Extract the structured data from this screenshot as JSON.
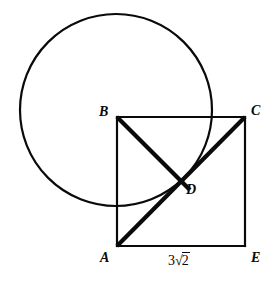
{
  "figure": {
    "kind": "geometry-diagram",
    "width": 275,
    "height": 281,
    "background_color": "#ffffff",
    "stroke_color": "#0a0a0a"
  },
  "vertices": {
    "A": {
      "label": "A",
      "x": 117,
      "y": 246,
      "label_x": 100,
      "label_y": 251
    },
    "B": {
      "label": "B",
      "x": 117,
      "y": 117,
      "label_x": 99,
      "label_y": 105
    },
    "C": {
      "label": "C",
      "x": 245,
      "y": 117,
      "label_x": 251,
      "label_y": 104
    },
    "D": {
      "label": "D",
      "x": 182,
      "y": 183,
      "label_x": 186,
      "label_y": 183
    },
    "E": {
      "label": "E",
      "x": 245,
      "y": 246,
      "label_x": 251,
      "label_y": 251
    }
  },
  "circle": {
    "name": "overlapping-circle",
    "center_x": 116,
    "center_y": 110,
    "radius": 96,
    "stroke_width": 2.2
  },
  "square": {
    "name": "square-ABCE",
    "sides": [
      {
        "name": "side-AB",
        "x1": 117,
        "y1": 246,
        "x2": 117,
        "y2": 117,
        "stroke_width": 2.2
      },
      {
        "name": "side-BC",
        "x1": 117,
        "y1": 117,
        "x2": 245,
        "y2": 117,
        "stroke_width": 2.2
      },
      {
        "name": "side-CE",
        "x1": 245,
        "y1": 117,
        "x2": 245,
        "y2": 246,
        "stroke_width": 2.2
      },
      {
        "name": "side-AE",
        "x1": 117,
        "y1": 246,
        "x2": 245,
        "y2": 246,
        "stroke_width": 2.2
      }
    ]
  },
  "diagonals": [
    {
      "name": "segment-BD",
      "x1": 117,
      "y1": 117,
      "x2": 190,
      "y2": 190,
      "stroke_width": 4.2
    },
    {
      "name": "segment-AC",
      "x1": 117,
      "y1": 246,
      "x2": 245,
      "y2": 117,
      "stroke_width": 4.2
    }
  ],
  "measures": {
    "side_AE": {
      "name": "side-length-label",
      "coefficient": "3",
      "radical_sign": "√",
      "radicand": "2",
      "full_text": "3√2",
      "label_x": 168,
      "label_y": 254
    }
  },
  "colors": {
    "ink": "#0a0a0a",
    "paper": "#ffffff"
  }
}
